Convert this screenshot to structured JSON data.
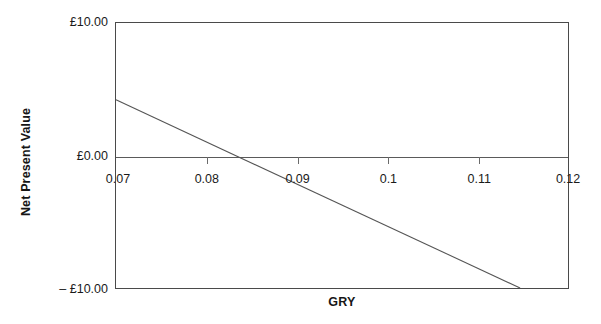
{
  "chart_data": {
    "type": "line",
    "title": "",
    "xlabel": "GRY",
    "ylabel": "Net Present Value",
    "xlim": [
      0.07,
      0.12
    ],
    "ylim": [
      -10.0,
      10.0
    ],
    "grid": false,
    "legend": false,
    "zero_line": true,
    "x_ticks": [
      0.07,
      0.08,
      0.09,
      0.1,
      0.11,
      0.12
    ],
    "x_tick_labels": [
      "0.07",
      "0.08",
      "0.09",
      "0.1",
      "0.11",
      "0.12"
    ],
    "y_ticks": [
      10.0,
      0.0,
      -10.0
    ],
    "y_tick_labels": [
      "£10.00",
      "£0.00",
      "– £10.00"
    ],
    "series": [
      {
        "name": "Net Present Value",
        "color": "#555555",
        "x": [
          0.07,
          0.1147
        ],
        "values": [
          4.2,
          -10.0
        ],
        "zero_crossing_x": 0.0816
      }
    ],
    "annotations": []
  },
  "axes": {
    "x_title": "GRY",
    "y_title": "Net Present Value"
  },
  "colors": {
    "background": "#ffffff",
    "plot_border": "#4a4a4a",
    "axis_line": "#5a5a5a",
    "tick_mark": "#6b6b6b",
    "series_line": "#555555",
    "text": "#1a1a1a"
  }
}
